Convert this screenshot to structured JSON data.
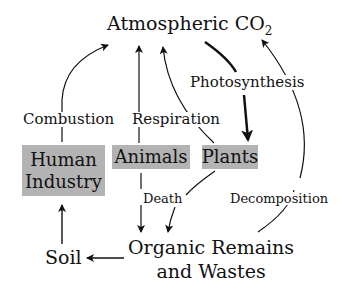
{
  "diagram": {
    "title_main": "Atmospheric CO",
    "title_sub": "2",
    "nodes": {
      "human_industry": "Human Industry",
      "human_line1": "Human",
      "human_line2": "Industry",
      "animals": "Animals",
      "plants": "Plants",
      "soil": "Soil",
      "organic_line1": "Organic Remains",
      "organic_line2": "and Wastes"
    },
    "edges": {
      "combustion": "Combustion",
      "respiration": "Respiration",
      "photosynthesis": "Photosynthesis",
      "death": "Death",
      "decomposition": "Decomposition"
    },
    "colors": {
      "box_fill": "#b3b3b3",
      "stroke": "#111111"
    }
  }
}
